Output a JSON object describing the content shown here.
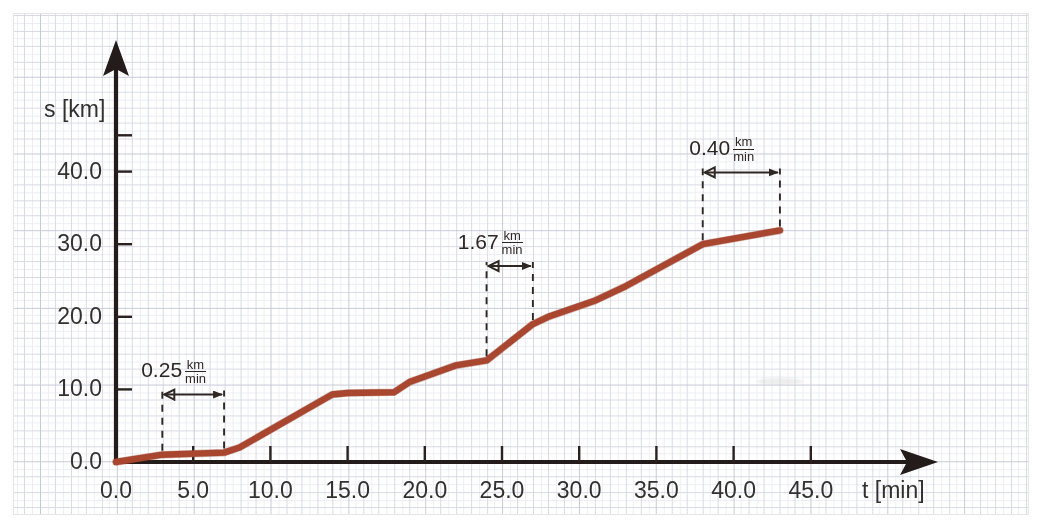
{
  "figure": {
    "axes": {
      "y_label": "s [km]",
      "x_label": "t [min]",
      "y_ticks": [
        "0.0",
        "10.0",
        "20.0",
        "30.0",
        "40.0"
      ],
      "x_ticks": [
        "0.0",
        "5.0",
        "10.0",
        "15.0",
        "20.0",
        "25.0",
        "30.0",
        "35.0",
        "40.0",
        "45.0"
      ]
    },
    "annotations": [
      {
        "value": "0.25",
        "unit_num": "km",
        "unit_den": "min",
        "t_from": 3.0,
        "t_to": 7.0
      },
      {
        "value": "1.67",
        "unit_num": "km",
        "unit_den": "min",
        "t_from": 24.0,
        "t_to": 27.0
      },
      {
        "value": "0.40",
        "unit_num": "km",
        "unit_den": "min",
        "t_from": 38.0,
        "t_to": 43.0
      }
    ],
    "curve_color": "#a8462f",
    "axis_color": "#241c1a",
    "grid_color": "#d8d8e2"
  },
  "chart_data": {
    "type": "line",
    "title": "",
    "xlabel": "t [min]",
    "ylabel": "s [km]",
    "xlim": [
      0.0,
      47.0
    ],
    "ylim": [
      0.0,
      45.0
    ],
    "grid": true,
    "legend": "none",
    "x": [
      0.0,
      3.0,
      7.0,
      8.0,
      14.0,
      15.0,
      18.0,
      19.0,
      22.0,
      24.0,
      27.0,
      28.0,
      31.0,
      33.0,
      38.0,
      43.0
    ],
    "y": [
      0.0,
      1.0,
      1.3,
      2.0,
      9.3,
      9.5,
      9.6,
      11.0,
      13.3,
      14.0,
      19.0,
      20.0,
      22.2,
      24.2,
      30.0,
      31.9
    ],
    "series": [
      {
        "name": "s(t)",
        "color": "#a8462f",
        "points": [
          {
            "t": 0.0,
            "s": 0.0
          },
          {
            "t": 3.0,
            "s": 1.0
          },
          {
            "t": 7.0,
            "s": 1.3
          },
          {
            "t": 8.0,
            "s": 2.0
          },
          {
            "t": 14.0,
            "s": 9.3
          },
          {
            "t": 15.0,
            "s": 9.5
          },
          {
            "t": 18.0,
            "s": 9.6
          },
          {
            "t": 19.0,
            "s": 11.0
          },
          {
            "t": 22.0,
            "s": 13.3
          },
          {
            "t": 24.0,
            "s": 14.0
          },
          {
            "t": 27.0,
            "s": 19.0
          },
          {
            "t": 28.0,
            "s": 20.0
          },
          {
            "t": 31.0,
            "s": 22.2
          },
          {
            "t": 33.0,
            "s": 24.2
          },
          {
            "t": 38.0,
            "s": 30.0
          },
          {
            "t": 43.0,
            "s": 31.9
          }
        ]
      }
    ],
    "annotations": [
      {
        "label": "0.25 km/min",
        "slope": 0.25,
        "t_from": 3.0,
        "t_to": 7.0
      },
      {
        "label": "1.67 km/min",
        "slope": 1.67,
        "t_from": 24.0,
        "t_to": 27.0
      },
      {
        "label": "0.40 km/min",
        "slope": 0.4,
        "t_from": 38.0,
        "t_to": 43.0
      }
    ]
  }
}
